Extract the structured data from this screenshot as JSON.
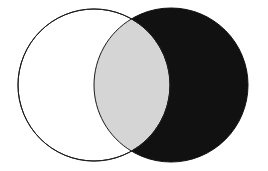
{
  "figure": {
    "kind": "venn-diagram",
    "background_color": "#ffffff",
    "width": 268,
    "height": 171
  },
  "chart_data": {
    "type": "diagram",
    "subtype": "venn2",
    "title": "",
    "xlabel": "",
    "ylabel": "",
    "grid": false,
    "legend": "none",
    "labels": [],
    "sets": [
      {
        "name": "left-set",
        "fill": "#ffffff",
        "stroke": "#1a1a1a",
        "stroke_width": 1,
        "center_x": 94,
        "center_y": 85,
        "radius": 76
      },
      {
        "name": "right-set",
        "fill": "#111111",
        "stroke": "#111111",
        "stroke_width": 1,
        "center_x": 171,
        "center_y": 85,
        "radius": 77
      }
    ],
    "intersection": {
      "name": "overlap-lens",
      "fill": "#d5d5d5",
      "stroke": "#1a1a1a",
      "stroke_width": 1,
      "top_point_x": 141,
      "top_point_y": 15,
      "bottom_point_x": 141,
      "bottom_point_y": 155
    }
  },
  "colors": {
    "white_fill": "#ffffff",
    "black_fill": "#111111",
    "gray_fill": "#d5d5d5",
    "outline": "#1a1a1a"
  }
}
